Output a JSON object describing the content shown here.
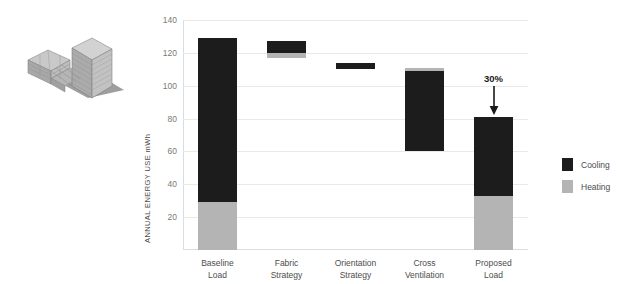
{
  "figure": {
    "illustration_name": "building-massing-axonometric"
  },
  "legend": {
    "items": [
      {
        "label": "Cooling",
        "color": "#1c1c1c"
      },
      {
        "label": "Heating",
        "color": "#b4b4b4"
      }
    ]
  },
  "chart_data": {
    "type": "bar",
    "title": "",
    "subtitle": "",
    "xlabel": "",
    "ylabel": "ANNUAL ENERGY USE mWh",
    "ylim": [
      0,
      140
    ],
    "yticks": [
      20,
      40,
      60,
      80,
      100,
      120,
      140
    ],
    "ytick_labels": [
      "20",
      "40",
      "60",
      "80",
      "100",
      "120",
      "140"
    ],
    "grid": true,
    "legend_position": "right",
    "waterfall": true,
    "categories": [
      "Baseline Load",
      "Fabric Strategy",
      "Orientation Strategy",
      "Cross Ventilation",
      "Proposed Load"
    ],
    "category_lines": [
      [
        "Baseline",
        "Load"
      ],
      [
        "Fabric",
        "Strategy"
      ],
      [
        "Orientation",
        "Strategy"
      ],
      [
        "Cross",
        "Ventilation"
      ],
      [
        "Proposed",
        "Load"
      ]
    ],
    "series": [
      {
        "name": "Cooling",
        "color": "#1c1c1c",
        "values": [
          100,
          7,
          4,
          49,
          48
        ]
      },
      {
        "name": "Heating",
        "color": "#b4b4b4",
        "values": [
          29,
          3,
          0,
          2,
          33
        ]
      }
    ],
    "bars": [
      {
        "category": "Baseline Load",
        "base": 0,
        "heating_from": 0,
        "heating_to": 29,
        "cooling_from": 29,
        "cooling_to": 129,
        "total": 129
      },
      {
        "category": "Fabric Strategy",
        "base": 117,
        "heating_from": 117,
        "heating_to": 120,
        "cooling_from": 120,
        "cooling_to": 127,
        "total": 127
      },
      {
        "category": "Orientation Strategy",
        "base": 110,
        "heating_from": 110,
        "heating_to": 110,
        "cooling_from": 110,
        "cooling_to": 114,
        "total": 114
      },
      {
        "category": "Cross Ventilation",
        "base": 60,
        "heating_from": 109,
        "heating_to": 111,
        "cooling_from": 60,
        "cooling_to": 109,
        "total": 111
      },
      {
        "category": "Proposed Load",
        "base": 0,
        "heating_from": 0,
        "heating_to": 33,
        "cooling_from": 33,
        "cooling_to": 81,
        "total": 81
      }
    ],
    "annotations": [
      {
        "text": "30%",
        "target_category": "Proposed Load",
        "arrow": "down",
        "value": 81
      }
    ]
  }
}
